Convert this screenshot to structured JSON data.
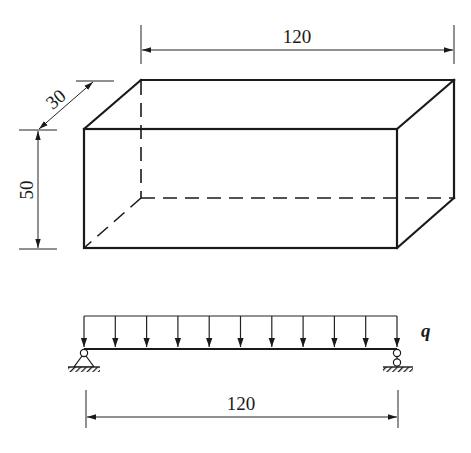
{
  "figure": {
    "box": {
      "length_label": "120",
      "depth_label": "30",
      "height_label": "50"
    },
    "beam": {
      "load_label": "q",
      "span_label": "120",
      "load_arrow_count": 11,
      "left_support": "pin",
      "right_support": "roller"
    },
    "colors": {
      "line": "#1a1a1a",
      "background": "#ffffff"
    }
  }
}
